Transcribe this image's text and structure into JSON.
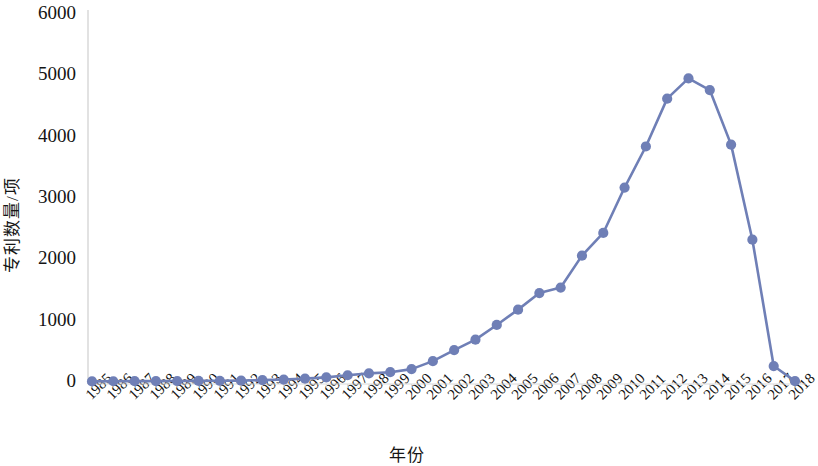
{
  "chart_data": {
    "type": "line",
    "title": "",
    "xlabel": "年份",
    "ylabel": "专利数量/项",
    "xlim": [
      1985,
      2018
    ],
    "ylim": [
      0,
      6000
    ],
    "ytick_labels": [
      "6000",
      "5000",
      "4000",
      "3000",
      "2000",
      "1000",
      "0"
    ],
    "yticks": [
      6000,
      5000,
      4000,
      3000,
      2000,
      1000,
      0
    ],
    "grid": false,
    "legend": null,
    "marker": "circle",
    "line_color": "#6F7FB6",
    "marker_color": "#6F7FB6",
    "categories": [
      "1985",
      "1986",
      "1987",
      "1988",
      "1989",
      "1990",
      "1991",
      "1992",
      "1993",
      "1994",
      "1995",
      "1996",
      "1997",
      "1998",
      "1999",
      "2000",
      "2001",
      "2002",
      "2003",
      "2004",
      "2005",
      "2006",
      "2007",
      "2008",
      "2009",
      "2010",
      "2011",
      "2012",
      "2013",
      "2014",
      "2015",
      "2016",
      "2017",
      "2018"
    ],
    "values": [
      10,
      12,
      14,
      15,
      16,
      18,
      20,
      22,
      30,
      40,
      55,
      75,
      110,
      140,
      160,
      210,
      340,
      520,
      690,
      930,
      1180,
      1450,
      1540,
      2060,
      2430,
      3170,
      3840,
      4620,
      4950,
      4760,
      3870,
      2320,
      260,
      15
    ]
  }
}
